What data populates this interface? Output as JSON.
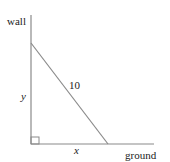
{
  "diagram": {
    "labels": {
      "wall": "wall",
      "ground": "ground",
      "height": "y",
      "base": "x",
      "hypotenuse": "10"
    },
    "colors": {
      "line": "#8a8a8a",
      "text": "#222222",
      "background": "#ffffff"
    }
  }
}
